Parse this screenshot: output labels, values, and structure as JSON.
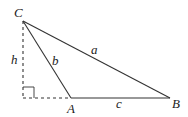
{
  "diagram": {
    "type": "triangle-with-altitude",
    "vertices": {
      "A": {
        "label": "A",
        "x": 71,
        "y": 98
      },
      "B": {
        "label": "B",
        "x": 170,
        "y": 98
      },
      "C": {
        "label": "C",
        "x": 23,
        "y": 21
      }
    },
    "foot": {
      "x": 23,
      "y": 98
    },
    "sides": {
      "a": {
        "label": "a",
        "from": "C",
        "to": "B"
      },
      "b": {
        "label": "b",
        "from": "C",
        "to": "A"
      },
      "c": {
        "label": "c",
        "from": "A",
        "to": "B"
      }
    },
    "altitude": {
      "label": "h",
      "style": "dashed"
    },
    "extension": {
      "style": "dashed",
      "from": "foot",
      "to": "A"
    },
    "right_angle_marker": true,
    "colors": {
      "stroke": "#333333",
      "background": "#ffffff"
    }
  }
}
